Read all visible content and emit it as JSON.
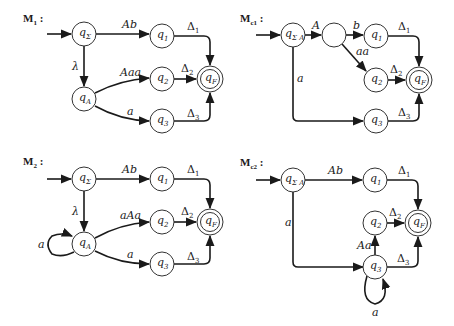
{
  "diagrams": [
    {
      "id": "M1",
      "title": {
        "main": "M",
        "sub": "1",
        "suffix": " :"
      },
      "title_pos": [
        23,
        22
      ],
      "states": [
        {
          "id": "qSigma",
          "name": "q",
          "sub": "Σ",
          "x": 84,
          "y": 34
        },
        {
          "id": "qA",
          "name": "q",
          "sub": "A",
          "x": 84,
          "y": 99
        },
        {
          "id": "q1",
          "name": "q",
          "sub": "1",
          "x": 162,
          "y": 36
        },
        {
          "id": "q2",
          "name": "q",
          "sub": "2",
          "x": 162,
          "y": 79
        },
        {
          "id": "q3",
          "name": "q",
          "sub": "3",
          "x": 162,
          "y": 121
        },
        {
          "id": "qF",
          "name": "q",
          "sub": "F",
          "x": 210,
          "y": 79,
          "final": true
        }
      ],
      "start_arrow": {
        "from": [
          47,
          34
        ],
        "to": [
          71,
          34
        ]
      },
      "edges": [
        {
          "d": "M96,34 L149,34",
          "label": "Ab",
          "lx": 122,
          "ly": 28
        },
        {
          "d": "M84,46 L84,86",
          "label": "λ",
          "lx": 72,
          "ly": 70
        },
        {
          "d": "M95,93 Q120,80 149,78",
          "label": "Aaa",
          "lx": 120,
          "ly": 76
        },
        {
          "d": "M95,106 Q120,120 149,121",
          "label": "a",
          "lx": 127,
          "ly": 115
        },
        {
          "d": "M174,36 L204,36 Q210,36 210,42 L210,65",
          "label": "Δ",
          "sub": "1",
          "lx": 187,
          "ly": 30,
          "delta": true
        },
        {
          "d": "M174,79 L196,79",
          "label": "Δ",
          "sub": "2",
          "lx": 181,
          "ly": 72,
          "delta": true
        },
        {
          "d": "M174,121 L204,121 Q210,121 210,115 L210,93",
          "label": "Δ",
          "sub": "3",
          "lx": 187,
          "ly": 117,
          "delta": true
        }
      ]
    },
    {
      "id": "Mc1",
      "title": {
        "main": "M",
        "sub": "c1",
        "suffix": " :"
      },
      "title_pos": [
        240,
        22
      ],
      "states": [
        {
          "id": "qSigmaA",
          "name": "q",
          "sub": "Σ A",
          "x": 293,
          "y": 35
        },
        {
          "id": "blank",
          "name": "",
          "sub": "",
          "x": 334,
          "y": 35
        },
        {
          "id": "q1",
          "name": "q",
          "sub": "1",
          "x": 376,
          "y": 36
        },
        {
          "id": "q2",
          "name": "q",
          "sub": "2",
          "x": 376,
          "y": 80
        },
        {
          "id": "q3",
          "name": "q",
          "sub": "3",
          "x": 376,
          "y": 121
        },
        {
          "id": "qF",
          "name": "q",
          "sub": "F",
          "x": 419,
          "y": 80,
          "final": true
        }
      ],
      "start_arrow": {
        "from": [
          256,
          35
        ],
        "to": [
          280,
          35
        ]
      },
      "edges": [
        {
          "d": "M305,35 L321,35",
          "label": "A",
          "lx": 312,
          "ly": 29
        },
        {
          "d": "M346,35 L363,35",
          "label": "b",
          "lx": 353,
          "ly": 29
        },
        {
          "d": "M342,44 L366,71",
          "label": "aa",
          "lx": 356,
          "ly": 55
        },
        {
          "d": "M293,47 L293,116 Q293,121 298,121 L363,121",
          "label": "a",
          "lx": 297,
          "ly": 82
        },
        {
          "d": "M388,36 L413,36 Q419,36 419,42 L419,66",
          "label": "Δ",
          "sub": "1",
          "lx": 398,
          "ly": 30,
          "delta": true
        },
        {
          "d": "M388,80 L405,80",
          "label": "Δ",
          "sub": "2",
          "lx": 390,
          "ly": 73,
          "delta": true
        },
        {
          "d": "M388,121 L413,121 Q419,121 419,115 L419,94",
          "label": "Δ",
          "sub": "3",
          "lx": 398,
          "ly": 116,
          "delta": true
        }
      ]
    },
    {
      "id": "M2",
      "title": {
        "main": "M",
        "sub": "2",
        "suffix": " :"
      },
      "title_pos": [
        23,
        165
      ],
      "states": [
        {
          "id": "qSigma",
          "name": "q",
          "sub": "Σ",
          "x": 84,
          "y": 179
        },
        {
          "id": "qA",
          "name": "q",
          "sub": "A",
          "x": 84,
          "y": 244
        },
        {
          "id": "q1",
          "name": "q",
          "sub": "1",
          "x": 162,
          "y": 179
        },
        {
          "id": "q2",
          "name": "q",
          "sub": "2",
          "x": 162,
          "y": 222
        },
        {
          "id": "q3",
          "name": "q",
          "sub": "3",
          "x": 162,
          "y": 264
        },
        {
          "id": "qF",
          "name": "q",
          "sub": "F",
          "x": 210,
          "y": 222,
          "final": true
        }
      ],
      "start_arrow": {
        "from": [
          47,
          179
        ],
        "to": [
          71,
          179
        ]
      },
      "edges": [
        {
          "d": "M96,179 L149,179",
          "label": "Ab",
          "lx": 122,
          "ly": 173
        },
        {
          "d": "M84,191 L84,231",
          "label": "λ",
          "lx": 72,
          "ly": 215
        },
        {
          "d": "M95,238 Q120,224 149,222",
          "label": "aAa",
          "lx": 120,
          "ly": 219
        },
        {
          "d": "M95,251 Q120,264 149,264",
          "label": "a",
          "lx": 127,
          "ly": 258
        },
        {
          "d": "M74,252 Q62,258 52,254 Q44,244 52,236 Q62,232 72,236",
          "label": "a",
          "lx": 38,
          "ly": 248
        },
        {
          "d": "M174,179 L204,179 Q210,179 210,185 L210,208",
          "label": "Δ",
          "sub": "1",
          "lx": 187,
          "ly": 173,
          "delta": true
        },
        {
          "d": "M174,222 L196,222",
          "label": "Δ",
          "sub": "2",
          "lx": 181,
          "ly": 215,
          "delta": true
        },
        {
          "d": "M174,264 L204,264 Q210,264 210,258 L210,236",
          "label": "Δ",
          "sub": "3",
          "lx": 187,
          "ly": 260,
          "delta": true
        }
      ]
    },
    {
      "id": "Mc2",
      "title": {
        "main": "M",
        "sub": "c2",
        "suffix": " :"
      },
      "title_pos": [
        240,
        166
      ],
      "states": [
        {
          "id": "qSigmaA",
          "name": "q",
          "sub": "Σ A",
          "x": 293,
          "y": 180
        },
        {
          "id": "q1",
          "name": "q",
          "sub": "1",
          "x": 375,
          "y": 180
        },
        {
          "id": "q2",
          "name": "q",
          "sub": "2",
          "x": 375,
          "y": 223
        },
        {
          "id": "q3",
          "name": "q",
          "sub": "3",
          "x": 375,
          "y": 267
        },
        {
          "id": "qF",
          "name": "q",
          "sub": "F",
          "x": 418,
          "y": 223,
          "final": true
        }
      ],
      "start_arrow": {
        "from": [
          256,
          180
        ],
        "to": [
          280,
          180
        ]
      },
      "edges": [
        {
          "d": "M305,180 L362,180",
          "label": "Ab",
          "lx": 328,
          "ly": 174
        },
        {
          "d": "M293,192 L293,262 Q293,267 298,267 L363,267",
          "label": "a",
          "lx": 285,
          "ly": 226
        },
        {
          "d": "M375,255 L375,236",
          "label": "Aa",
          "lx": 357,
          "ly": 249
        },
        {
          "d": "M367,276 Q360,300 375,304 Q390,300 383,279",
          "label": "a",
          "lx": 372,
          "ly": 316
        },
        {
          "d": "M387,180 L412,180 Q418,180 418,186 L418,209",
          "label": "Δ",
          "sub": "1",
          "lx": 398,
          "ly": 174,
          "delta": true
        },
        {
          "d": "M387,223 L404,223",
          "label": "Δ",
          "sub": "2",
          "lx": 389,
          "ly": 216,
          "delta": true
        },
        {
          "d": "M387,267 L412,267 Q418,267 418,261 L418,237",
          "label": "Δ",
          "sub": "3",
          "lx": 397,
          "ly": 262,
          "delta": true
        }
      ]
    }
  ],
  "colors": {
    "stroke": "#1a1a1a",
    "background": "#ffffff"
  }
}
